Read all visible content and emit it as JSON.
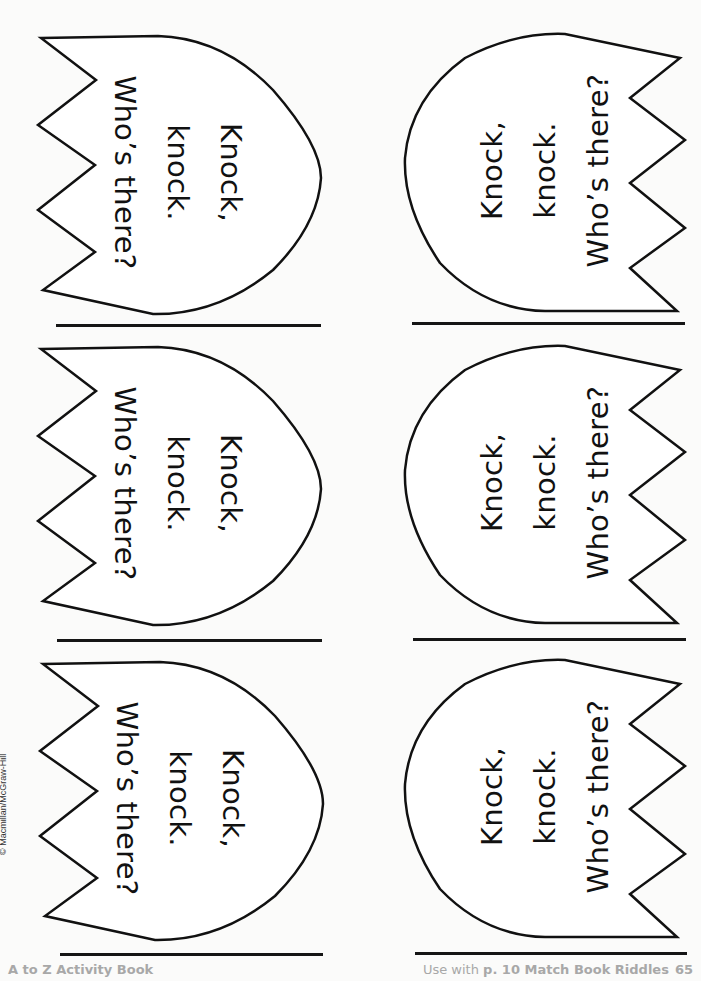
{
  "page": {
    "background": "#fbfbfa",
    "ink": "#111111",
    "footer_color": "#a8a8a8"
  },
  "cards": [
    {
      "column": "left",
      "row": 1,
      "lines": [
        "Knock,",
        "knock.",
        "Who’s there?"
      ]
    },
    {
      "column": "right",
      "row": 1,
      "lines": [
        "Knock,",
        "knock.",
        "Who’s there?"
      ]
    },
    {
      "column": "left",
      "row": 2,
      "lines": [
        "Knock,",
        "knock.",
        "Who’s there?"
      ]
    },
    {
      "column": "right",
      "row": 2,
      "lines": [
        "Knock,",
        "knock.",
        "Who’s there?"
      ]
    },
    {
      "column": "left",
      "row": 3,
      "lines": [
        "Knock,",
        "knock.",
        "Who’s there?"
      ]
    },
    {
      "column": "right",
      "row": 3,
      "lines": [
        "Knock,",
        "knock.",
        "Who’s there?"
      ]
    }
  ],
  "copyright": "© Macmillan/McGraw-Hill",
  "footer": {
    "left": "A to Z Activity Book",
    "right_prefix": "Use with ",
    "right_ref": "p. 10 Match Book Riddles",
    "page_number": "65"
  }
}
